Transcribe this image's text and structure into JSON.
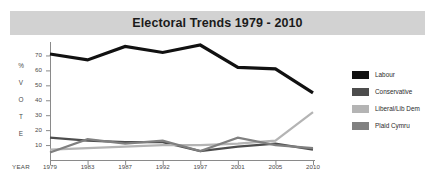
{
  "title": "Electoral Trends 1979 - 2010",
  "axes": {
    "y_caption_letters": [
      "%",
      "V",
      "O",
      "T",
      "E"
    ],
    "y_ticks": [
      70,
      60,
      50,
      40,
      30,
      20,
      10
    ],
    "x_caption": "YEAR"
  },
  "legend": {
    "items": [
      {
        "label": "Labour",
        "color": "#111111"
      },
      {
        "label": "Conservative",
        "color": "#4d4d4d"
      },
      {
        "label": "Liberal/Lib Dem",
        "color": "#b4b4b4"
      },
      {
        "label": "Plaid Cymru",
        "color": "#808080"
      }
    ]
  },
  "chart_data": {
    "type": "line",
    "title": "Electoral Trends 1979 - 2010",
    "xlabel": "YEAR",
    "ylabel": "% VOTE",
    "categories": [
      "1979",
      "1983",
      "1987",
      "1992",
      "1997",
      "2001",
      "2005",
      "2010"
    ],
    "x": [
      1979,
      1983,
      1987,
      1992,
      1997,
      2001,
      2005,
      2010
    ],
    "ylim": [
      0,
      75
    ],
    "yticks": [
      10,
      20,
      30,
      40,
      50,
      60,
      70
    ],
    "grid": false,
    "legend_position": "right",
    "series": [
      {
        "name": "Labour",
        "color": "#111111",
        "values": [
          71,
          67,
          76,
          72,
          77,
          62,
          61,
          45
        ]
      },
      {
        "name": "Conservative",
        "color": "#4d4d4d",
        "values": [
          15,
          13,
          12,
          12,
          6,
          9,
          11,
          7
        ]
      },
      {
        "name": "Liberal/Lib Dem",
        "color": "#b4b4b4",
        "values": [
          7,
          8,
          9,
          10,
          10,
          11,
          13,
          32
        ]
      },
      {
        "name": "Plaid Cymru",
        "color": "#808080",
        "values": [
          5,
          14,
          11,
          13,
          6,
          15,
          10,
          8
        ]
      }
    ]
  }
}
